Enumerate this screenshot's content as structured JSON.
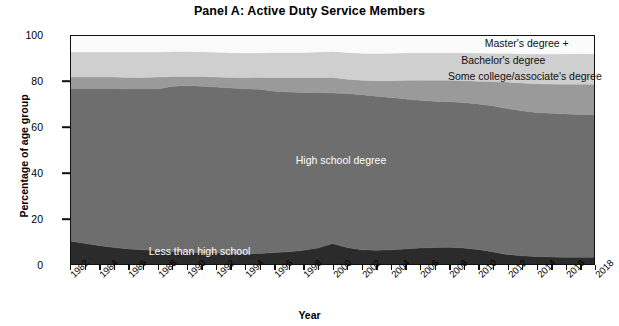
{
  "chart_data": {
    "type": "area",
    "stacked": true,
    "title": "Panel A: Active Duty Service Members",
    "xlabel": "Year",
    "ylabel": "Percentage of age group",
    "xlim": [
      1982,
      2018
    ],
    "ylim": [
      0,
      100
    ],
    "yticks": [
      0,
      20,
      40,
      60,
      80,
      100
    ],
    "xticks": [
      1982,
      1984,
      1986,
      1988,
      1990,
      1992,
      1994,
      1996,
      1998,
      2000,
      2002,
      2004,
      2006,
      2008,
      2010,
      2012,
      2014,
      2016,
      2018
    ],
    "grid": false,
    "legend_position": "inline-annotations",
    "x": [
      1982,
      1983,
      1984,
      1985,
      1986,
      1987,
      1988,
      1989,
      1990,
      1991,
      1992,
      1993,
      1994,
      1995,
      1996,
      1997,
      1998,
      1999,
      2000,
      2001,
      2002,
      2003,
      2004,
      2005,
      2006,
      2007,
      2008,
      2009,
      2010,
      2011,
      2012,
      2013,
      2014,
      2015,
      2016,
      2017,
      2018
    ],
    "series": [
      {
        "name": "Less than high school",
        "color": "#2b2b2b",
        "label_color": "#ffffff",
        "values": [
          10.0,
          9.0,
          8.0,
          7.2,
          6.6,
          6.2,
          5.8,
          5.5,
          5.2,
          5.0,
          4.8,
          4.6,
          4.5,
          4.6,
          5.0,
          5.4,
          6.0,
          7.0,
          9.0,
          7.2,
          6.2,
          6.0,
          6.2,
          6.6,
          7.0,
          7.2,
          7.4,
          7.0,
          6.4,
          5.4,
          4.2,
          3.6,
          3.3,
          3.1,
          3.0,
          3.0,
          3.0
        ]
      },
      {
        "name": "High school degree",
        "color": "#6e6e6e",
        "label_color": "#ffffff",
        "values": [
          67.0,
          68.0,
          69.0,
          69.8,
          70.2,
          70.6,
          71.0,
          72.5,
          73.0,
          73.0,
          72.8,
          72.6,
          72.4,
          72.0,
          70.8,
          70.0,
          69.2,
          68.2,
          66.0,
          67.6,
          68.0,
          67.6,
          66.8,
          65.8,
          64.8,
          64.2,
          63.8,
          63.8,
          63.8,
          64.0,
          64.0,
          63.6,
          63.2,
          63.0,
          62.8,
          62.6,
          62.4
        ]
      },
      {
        "name": "Some college/associate's degree",
        "color": "#9a9a9a",
        "label_color": "#111111",
        "values": [
          5.0,
          5.0,
          5.0,
          5.0,
          5.0,
          5.0,
          5.2,
          4.2,
          4.0,
          4.2,
          4.4,
          4.6,
          4.8,
          5.2,
          6.0,
          6.4,
          6.6,
          6.6,
          6.8,
          6.2,
          6.4,
          6.8,
          7.4,
          8.2,
          8.8,
          9.2,
          9.4,
          9.6,
          10.0,
          10.6,
          11.6,
          12.2,
          12.6,
          12.8,
          13.0,
          13.2,
          13.4
        ]
      },
      {
        "name": "Bachelor's degree",
        "color": "#cfcfcf",
        "label_color": "#111111",
        "values": [
          11.0,
          11.0,
          11.0,
          11.0,
          11.2,
          11.2,
          11.0,
          11.0,
          11.0,
          10.9,
          10.9,
          10.9,
          10.8,
          10.8,
          11.0,
          11.0,
          11.0,
          11.2,
          11.4,
          11.8,
          11.8,
          11.9,
          12.0,
          12.0,
          12.0,
          12.0,
          12.0,
          12.2,
          12.3,
          12.4,
          12.6,
          12.8,
          13.0,
          13.2,
          13.4,
          13.4,
          13.4
        ]
      },
      {
        "name": "Master's degree +",
        "color": "#fbfbfb",
        "label_color": "#111111",
        "values": [
          7.0,
          7.0,
          7.0,
          7.0,
          7.0,
          7.0,
          7.0,
          6.8,
          6.8,
          6.9,
          7.1,
          7.3,
          7.5,
          7.4,
          7.2,
          7.2,
          7.2,
          7.0,
          6.8,
          7.2,
          7.6,
          7.7,
          7.6,
          7.4,
          7.4,
          7.4,
          7.4,
          7.4,
          7.5,
          7.6,
          7.6,
          7.8,
          7.9,
          7.9,
          7.8,
          7.8,
          7.8
        ]
      }
    ],
    "annotations": [
      {
        "text": "Master's degree +",
        "x_pct": 79.0,
        "y_pct": 96.6,
        "tone": "dark"
      },
      {
        "text": "Bachelor's degree",
        "x_pct": 74.5,
        "y_pct": 89.0,
        "tone": "dark"
      },
      {
        "text": "Some college/associate's degree",
        "x_pct": 72.0,
        "y_pct": 82.0,
        "tone": "dark"
      },
      {
        "text": "High school degree",
        "x_pct": 43.0,
        "y_pct": 45.5,
        "tone": "light"
      },
      {
        "text": "Less than high school",
        "x_pct": 15.0,
        "y_pct": 6.0,
        "tone": "light"
      }
    ]
  }
}
